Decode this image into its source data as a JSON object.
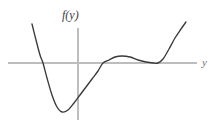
{
  "figure": {
    "width": 216,
    "height": 127,
    "background": "#ffffff",
    "function_label": "f(y)",
    "horizontal_axis_label": "y",
    "curve_color": "#3a3a3a",
    "axis_color": "#bdbdbd"
  },
  "chart_data": {
    "type": "line",
    "title": "",
    "subtitle": "",
    "xlabel": "y",
    "ylabel": "f(y)",
    "grid": false,
    "legend_position": "none",
    "axes": {
      "horizontal_axis_pixel_y": 63,
      "horizontal_axis_pixel_x_start": 8,
      "horizontal_axis_pixel_x_end": 197,
      "vertical_axis_pixel_x": 78,
      "vertical_axis_pixel_y_start": 28,
      "vertical_axis_pixel_y_end": 120,
      "xlim": [
        -4.6,
        5.9
      ],
      "ylim": [
        -3.1,
        2.2
      ],
      "x_tick_labels": [],
      "y_tick_labels": []
    },
    "series": [
      {
        "name": "f(y)",
        "description": "Quartic-like curve: falls steeply from upper left, crosses zero, reaches a deep local minimum below the axis, rises crossing zero again to a shallow local maximum above the axis, descends to touch the axis tangentially (double root), then rises steeply.",
        "points_pixel": [
          [
            32,
            24
          ],
          [
            36,
            40
          ],
          [
            40,
            55
          ],
          [
            43,
            63
          ],
          [
            47,
            78
          ],
          [
            52,
            95
          ],
          [
            57,
            107
          ],
          [
            62,
            112
          ],
          [
            68,
            110
          ],
          [
            74,
            103
          ],
          [
            80,
            95
          ],
          [
            86,
            87
          ],
          [
            92,
            79
          ],
          [
            98,
            71
          ],
          [
            103,
            63
          ],
          [
            109,
            60
          ],
          [
            115,
            57
          ],
          [
            122,
            56
          ],
          [
            130,
            57
          ],
          [
            138,
            60
          ],
          [
            146,
            62
          ],
          [
            153,
            63
          ],
          [
            158,
            63
          ],
          [
            163,
            59
          ],
          [
            169,
            49
          ],
          [
            175,
            38
          ],
          [
            181,
            29
          ],
          [
            186,
            22
          ]
        ],
        "x": [
          -4.55,
          -4.35,
          -4.15,
          -4.0,
          -3.8,
          -3.55,
          -3.3,
          -3.05,
          -2.75,
          -2.45,
          -2.15,
          -1.85,
          -1.55,
          -1.25,
          -1.0,
          -0.7,
          -0.4,
          -0.05,
          0.35,
          0.75,
          1.15,
          1.5,
          1.75,
          2.0,
          2.3,
          2.6,
          2.9,
          3.15
        ],
        "y": [
          1.3,
          0.77,
          0.27,
          0.0,
          -0.5,
          -1.07,
          -1.47,
          -1.63,
          -1.57,
          -1.33,
          -1.07,
          -0.8,
          -0.53,
          -0.27,
          0.0,
          0.1,
          0.2,
          0.23,
          0.2,
          0.1,
          0.03,
          0.0,
          0.0,
          0.13,
          0.47,
          0.83,
          1.13,
          1.37
        ]
      }
    ],
    "annotations": [
      {
        "text": "f(y)",
        "role": "vertical-axis-label",
        "pixel": [
          70,
          17
        ]
      },
      {
        "text": "y",
        "role": "horizontal-axis-label",
        "pixel": [
          205,
          63
        ]
      }
    ],
    "features": {
      "roots_pixel_x": [
        43,
        103,
        157
      ],
      "local_minimum_pixel": [
        61,
        112
      ],
      "local_maximum_pixel": [
        121,
        56
      ],
      "tangent_touch_pixel": [
        157,
        63
      ]
    }
  }
}
